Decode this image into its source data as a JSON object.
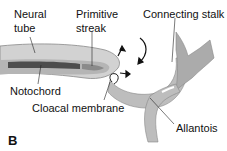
{
  "figure": {
    "panel_label": "B",
    "labels": {
      "neural_tube_1": "Neural",
      "neural_tube_2": "tube",
      "primitive_streak_1": "Primitive",
      "primitive_streak_2": "streak",
      "connecting_stalk": "Connecting stalk",
      "notochord": "Notochord",
      "cloacal_membrane": "Cloacal membrane",
      "allantois": "Allantois"
    },
    "colors": {
      "ectoderm": "#c8c8c8",
      "mesoderm_stalk": "#a8a8a8",
      "notochord": "#555555",
      "outline": "#777777"
    }
  }
}
